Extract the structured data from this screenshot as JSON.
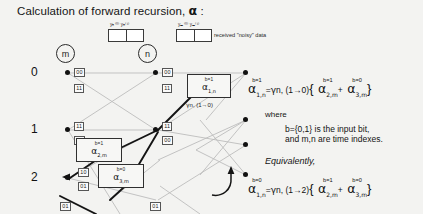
{
  "slide": {
    "title_prefix": "Calculation of forward recursion,",
    "title_symbol": "α",
    "title_suffix": ":"
  },
  "received": {
    "left_label": "yₙ⁽⁰⁾ yₙ⁽¹⁾",
    "right_label": "yₘ⁽⁰⁾ yₘ⁽¹⁾",
    "caption": "received \"noisy\" data"
  },
  "markers": {
    "left": "m",
    "right": "n"
  },
  "trellis": {
    "state_labels": [
      "0",
      "1",
      "2"
    ],
    "edge_labels_left": [
      "00",
      "11",
      "11",
      "00",
      "10",
      "01",
      "01"
    ],
    "edge_labels_mid": [
      "00",
      "11",
      "11",
      "00",
      "01"
    ]
  },
  "alpha_boxes": [
    {
      "name": "alpha-2-m",
      "b": "b=1",
      "symbol": "α",
      "sub": "2,m"
    },
    {
      "name": "alpha-3-m",
      "b": "b=0",
      "symbol": "α",
      "sub": "3,m"
    },
    {
      "name": "alpha-1-n",
      "b": "b=1",
      "symbol": "α",
      "sub": "1,n"
    }
  ],
  "gamma_label": {
    "symbol": "γ",
    "sub": "n, (1→0)"
  },
  "equation_1": {
    "lhs": {
      "symbol": "α",
      "sup": "b=1",
      "sub": "1,n"
    },
    "eq": "=",
    "gamma": {
      "symbol": "γ",
      "sub": "n, (1→0)"
    },
    "open": "{",
    "term1": {
      "symbol": "α",
      "sup": "b=1",
      "sub": "2,m"
    },
    "plus": "+",
    "term2": {
      "symbol": "α",
      "sup": "b=0",
      "sub": "3,m"
    },
    "close": "}"
  },
  "where_label": "where",
  "explanation_line1": "b={0,1} is the input bit,",
  "explanation_line2": "and m,n are time indexes.",
  "equivalently_label": "Equivalently,",
  "equation_2": {
    "lhs": {
      "symbol": "α",
      "sup": "b=0",
      "sub": "1,n"
    },
    "eq": "=",
    "gamma": {
      "symbol": "γ",
      "sub": "n, (1→2)"
    },
    "open": "{",
    "term1": {
      "symbol": "α",
      "sup": "b=1",
      "sub": "2,m"
    },
    "plus": "+",
    "term2": {
      "symbol": "α",
      "sup": "b=0",
      "sub": "3,m"
    },
    "close": "}"
  }
}
